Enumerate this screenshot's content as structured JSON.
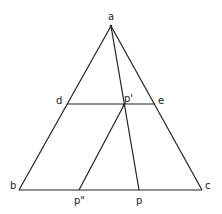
{
  "diagram": {
    "type": "geometry",
    "points": {
      "a": {
        "label": "a",
        "x": 111,
        "y": 26
      },
      "b": {
        "label": "b",
        "x": 19,
        "y": 190
      },
      "c": {
        "label": "c",
        "x": 202,
        "y": 190
      },
      "d": {
        "label": "d",
        "x": 67,
        "y": 104
      },
      "e": {
        "label": "e",
        "x": 155,
        "y": 104
      },
      "p1": {
        "label": "p'",
        "x": 124,
        "y": 105
      },
      "p": {
        "label": "p",
        "x": 139,
        "y": 190
      },
      "p2": {
        "label": "p\"",
        "x": 79,
        "y": 190
      }
    },
    "segments": [
      [
        "a",
        "b"
      ],
      [
        "a",
        "c"
      ],
      [
        "b",
        "c"
      ],
      [
        "d",
        "e"
      ],
      [
        "a",
        "p"
      ],
      [
        "p1",
        "p2"
      ]
    ],
    "labels": {
      "a": "a",
      "b": "b",
      "c": "c",
      "d": "d",
      "e": "e",
      "p1": "p'",
      "p": "p",
      "p2": "p\""
    },
    "stroke_color": "#222222"
  }
}
